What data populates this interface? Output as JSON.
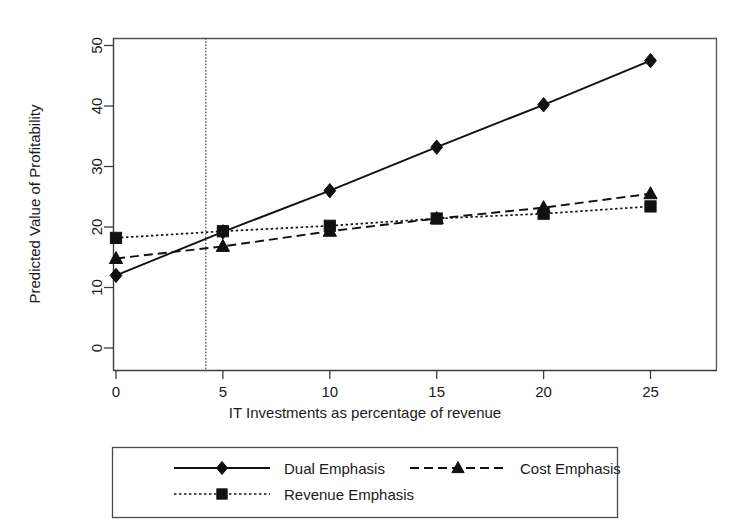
{
  "chart_data": {
    "type": "line",
    "title": "",
    "xlabel": "IT Investments as percentage of revenue",
    "ylabel": "Predicted Value of Profitability",
    "x": [
      0,
      5,
      10,
      15,
      20,
      25
    ],
    "xticklabels": [
      "0",
      "5",
      "10",
      "15",
      "20",
      "25"
    ],
    "yticklabels": [
      "0",
      "10",
      "20",
      "30",
      "40",
      "50"
    ],
    "yticks": [
      0,
      10,
      20,
      30,
      40,
      50
    ],
    "xlim": [
      -1.2,
      26.5
    ],
    "ylim": [
      -1.5,
      52
    ],
    "grid": false,
    "legend_position": "below-axes",
    "annotations": [
      {
        "type": "vertical-reference-line",
        "x": 4.2,
        "style": "dotted",
        "label": ""
      }
    ],
    "series": [
      {
        "name": "Dual Emphasis",
        "values": [
          12.0,
          19.2,
          26.0,
          33.2,
          40.2,
          47.5
        ],
        "marker": "diamond",
        "linestyle": "solid",
        "color": "#111111"
      },
      {
        "name": "Cost Emphasis",
        "values": [
          14.8,
          16.8,
          19.3,
          21.4,
          23.2,
          25.5
        ],
        "marker": "triangle",
        "linestyle": "dashed",
        "color": "#111111"
      },
      {
        "name": "Revenue Emphasis",
        "values": [
          18.2,
          19.3,
          20.2,
          21.4,
          22.2,
          23.4
        ],
        "marker": "square",
        "linestyle": "dotted",
        "color": "#111111"
      }
    ]
  },
  "legend": {
    "entries": [
      {
        "label": "Dual Emphasis",
        "marker": "diamond",
        "linestyle": "solid"
      },
      {
        "label": "Cost Emphasis",
        "marker": "triangle",
        "linestyle": "dashed"
      },
      {
        "label": "Revenue Emphasis",
        "marker": "square",
        "linestyle": "dotted"
      }
    ]
  },
  "colors": {
    "ink": "#111111",
    "axis": "#3d3d3d",
    "frame": "#555555",
    "background": "#ffffff"
  }
}
